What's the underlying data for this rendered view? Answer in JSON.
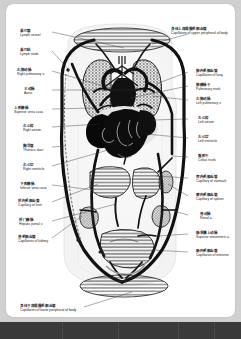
{
  "document": {
    "title": "Human Circulatory System Diagram",
    "page_background": "#ffffff",
    "surround_color": "#d0d0d0",
    "taskbar_color": "#3a3a3a",
    "ink_color": "#111111"
  },
  "diagram": {
    "type": "anatomical-schematic",
    "organs_depicted": [
      "capillaries of upper peripheral body",
      "right lung",
      "left lung",
      "heart",
      "liver",
      "stomach",
      "spleen",
      "kidneys",
      "intestine",
      "capillaries of lower peripheral body"
    ]
  },
  "labels_left": [
    {
      "cn": "淋巴管",
      "en": "Lymph vessel",
      "top": 26,
      "left": 14
    },
    {
      "cn": "淋巴结",
      "en": "Lymph node",
      "top": 45,
      "left": 14
    },
    {
      "cn": "右肺动脉",
      "en": "Right pulmonary v.",
      "top": 65,
      "left": 11
    },
    {
      "cn": "主动脉",
      "en": "Aorta",
      "top": 84,
      "left": 18
    },
    {
      "cn": "上腔静脉",
      "en": "Superior vena cava",
      "top": 103,
      "left": 8
    },
    {
      "cn": "右心房",
      "en": "Right atrium",
      "top": 121,
      "left": 17
    },
    {
      "cn": "胸导管",
      "en": "Thoracic duct",
      "top": 141,
      "left": 17
    },
    {
      "cn": "右心室",
      "en": "Right ventricle",
      "top": 160,
      "left": 17
    },
    {
      "cn": "下腔静脉",
      "en": "Inferior vena cava",
      "top": 179,
      "left": 14
    },
    {
      "cn": "肝内毛细血管",
      "en": "Capillary of liver",
      "top": 196,
      "left": 12
    },
    {
      "cn": "肝门静脉",
      "en": "Hepatic portal v.",
      "top": 215,
      "left": 13
    },
    {
      "cn": "肾毛细血管",
      "en": "Capillaries of kidney",
      "top": 232,
      "left": 12
    }
  ],
  "labels_right": [
    {
      "cn": "身体上部周围毛细血管",
      "en": "Capillaries of upper peripheral of body",
      "top": 24,
      "left": 165
    },
    {
      "cn": "肺内毛细血管",
      "en": "Capillaries of lung",
      "top": 66,
      "left": 190
    },
    {
      "cn": "肺静脉干",
      "en": "Pulmonary trunk",
      "top": 80,
      "left": 190
    },
    {
      "cn": "左肺动脉",
      "en": "Left pulmonary v.",
      "top": 94,
      "left": 190
    },
    {
      "cn": "左心房",
      "en": "Left atrium",
      "top": 113,
      "left": 192
    },
    {
      "cn": "左心室",
      "en": "Left ventricle",
      "top": 132,
      "left": 192
    },
    {
      "cn": "腹腔干",
      "en": "Celiac trunk",
      "top": 151,
      "left": 192
    },
    {
      "cn": "胃内毛细血管",
      "en": "Capillary of stomach",
      "top": 172,
      "left": 190
    },
    {
      "cn": "脾内毛细血管",
      "en": "Capillary of spleen",
      "top": 190,
      "left": 190
    },
    {
      "cn": "肾动脉",
      "en": "Renal a.",
      "top": 209,
      "left": 194
    },
    {
      "cn": "肠系膜上动脉",
      "en": "Superior mesenteric a.",
      "top": 228,
      "left": 190
    },
    {
      "cn": "肠内毛细血管",
      "en": "Capillaries of intestine",
      "top": 246,
      "left": 190
    }
  ],
  "labels_bottom": [
    {
      "cn": "身体下部周围毛细血管",
      "en": "Capillaries of lower peripheral of body",
      "top": 301,
      "left": 14
    }
  ]
}
